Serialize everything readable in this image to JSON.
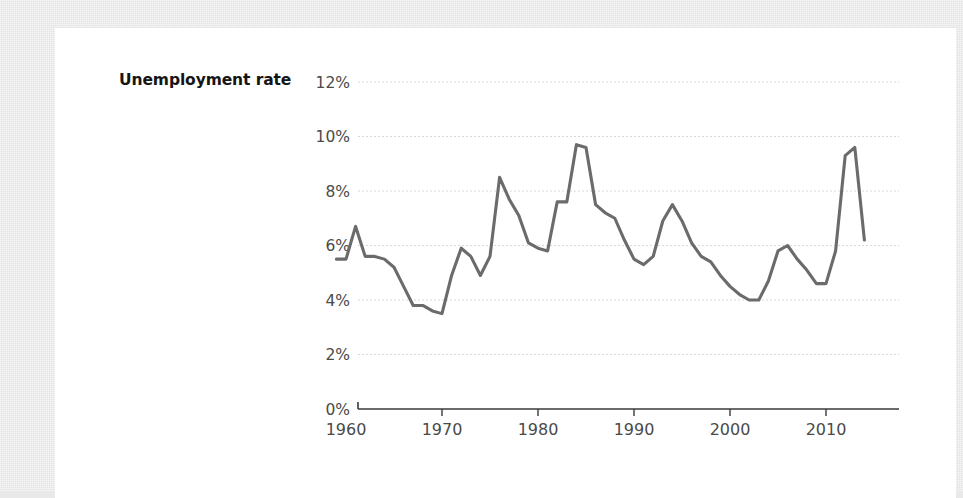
{
  "background": {
    "outer_color": "#e9e9e9",
    "card_color": "#ffffff"
  },
  "chart_label": "Unemployment rate",
  "chart_data": {
    "type": "line",
    "title": "Unemployment rate",
    "xlabel": "",
    "ylabel": "Unemployment rate",
    "line_color": "#6b6b6b",
    "grid": true,
    "gridline_color": "#d8d8d8",
    "legend": "none",
    "xlim": [
      1959,
      2015
    ],
    "ylim": [
      0,
      12
    ],
    "ytick_labels": [
      "12%",
      "10%",
      "8%",
      "6%",
      "4%",
      "2%",
      "0%"
    ],
    "ytick_values": [
      12,
      10,
      8,
      6,
      4,
      2,
      0
    ],
    "xtick_labels": [
      "1960",
      "1970",
      "1980",
      "1990",
      "2000",
      "2010"
    ],
    "xtick_values": [
      1960,
      1970,
      1980,
      1990,
      2000,
      2010
    ],
    "x": [
      1959,
      1960,
      1961,
      1962,
      1963,
      1964,
      1965,
      1966,
      1967,
      1968,
      1969,
      1970,
      1971,
      1972,
      1973,
      1974,
      1975,
      1976,
      1977,
      1978,
      1979,
      1980,
      1981,
      1982,
      1983,
      1984,
      1985,
      1986,
      1987,
      1988,
      1989,
      1990,
      1991,
      1992,
      1993,
      1994,
      1995,
      1996,
      1997,
      1998,
      1999,
      2000,
      2001,
      2002,
      2003,
      2004,
      2005,
      2006,
      2007,
      2008,
      2009,
      2010,
      2011,
      2012,
      2013,
      2014
    ],
    "y": [
      5.5,
      5.5,
      6.7,
      5.6,
      5.6,
      5.5,
      5.2,
      4.5,
      3.8,
      3.8,
      3.6,
      3.5,
      4.9,
      5.9,
      5.6,
      4.9,
      5.6,
      8.5,
      7.7,
      7.1,
      6.1,
      5.9,
      5.8,
      7.6,
      7.6,
      9.7,
      9.6,
      7.5,
      7.2,
      7.0,
      6.2,
      5.5,
      5.3,
      5.6,
      6.9,
      7.5,
      6.9,
      6.1,
      5.6,
      5.4,
      4.9,
      4.5,
      4.2,
      4.0,
      4.0,
      4.7,
      5.8,
      6.0,
      5.5,
      5.1,
      4.6,
      4.6,
      5.8,
      9.3,
      9.6,
      6.2
    ],
    "annotations": [],
    "data_points_note": "US unemployment rate, 1960-2014"
  }
}
